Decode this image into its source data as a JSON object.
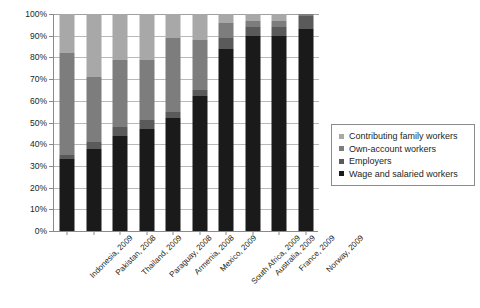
{
  "chart_data": {
    "type": "bar",
    "title": "",
    "xlabel": "",
    "ylabel": "",
    "ylim": [
      0,
      100
    ],
    "ytick_labels": [
      "0%",
      "10%",
      "20%",
      "30%",
      "40%",
      "50%",
      "60%",
      "70%",
      "80%",
      "90%",
      "100%"
    ],
    "ytick_values": [
      0,
      10,
      20,
      30,
      40,
      50,
      60,
      70,
      80,
      90,
      100
    ],
    "grid": true,
    "stacked": true,
    "stack_percent": true,
    "legend_position": "right",
    "categories": [
      "Indonesia, 2009",
      "Pakistan, 2008",
      "Thailand, 2009",
      "Paraguay, 2008",
      "Armenia, 2008",
      "Mexico, 2009",
      "South Africa, 2009",
      "Australia, 2009",
      "France, 2009",
      "Norway, 2009"
    ],
    "series": [
      {
        "name": "Wage and salaried workers",
        "color": "#1a1a1a",
        "values": [
          33,
          38,
          44,
          47,
          52,
          62,
          84,
          90,
          90,
          93
        ]
      },
      {
        "name": "Employers",
        "color": "#5a5a5a",
        "values": [
          2,
          3,
          4,
          4,
          3,
          3,
          5,
          4,
          4,
          6
        ]
      },
      {
        "name": "Own-account workers",
        "color": "#7d7d7d",
        "values": [
          47,
          30,
          31,
          28,
          34,
          23,
          7,
          3,
          3,
          1
        ]
      },
      {
        "name": "Contributing family workers",
        "color": "#a8a8a8",
        "values": [
          18,
          29,
          21,
          21,
          11,
          12,
          4,
          3,
          3,
          0
        ]
      }
    ]
  },
  "legend": {
    "items": [
      {
        "label": "Contributing family workers",
        "color": "#a8a8a8"
      },
      {
        "label": "Own-account workers",
        "color": "#7d7d7d"
      },
      {
        "label": "Employers",
        "color": "#5a5a5a"
      },
      {
        "label": "Wage and salaried workers",
        "color": "#1a1a1a"
      }
    ]
  },
  "colors": {
    "axis": "#8a8a8a",
    "grid": "#b9b9b9",
    "text": "#231f20",
    "background": "#ffffff"
  }
}
